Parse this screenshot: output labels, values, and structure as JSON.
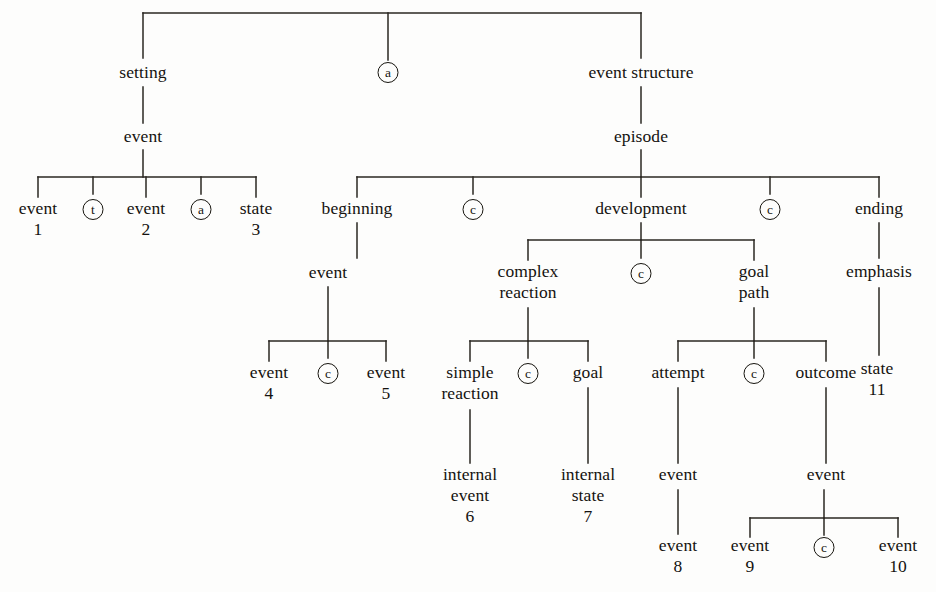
{
  "diagram": {
    "line_color": "#2a2722",
    "text_color": "#14120f",
    "background": "#fdfdfc"
  },
  "nodes": {
    "setting": {
      "label": "setting"
    },
    "root_connective_a": {
      "label": "a"
    },
    "event_structure": {
      "label": "event structure"
    },
    "setting_event": {
      "label": "event"
    },
    "event1": {
      "line1": "event",
      "line2": "1"
    },
    "connective_t": {
      "label": "t"
    },
    "event2": {
      "line1": "event",
      "line2": "2"
    },
    "connective_a_setting": {
      "label": "a"
    },
    "state3": {
      "line1": "state",
      "line2": "3"
    },
    "episode": {
      "label": "episode"
    },
    "beginning": {
      "label": "beginning"
    },
    "connective_c_1": {
      "label": "c"
    },
    "development": {
      "label": "development"
    },
    "connective_c_2": {
      "label": "c"
    },
    "ending": {
      "label": "ending"
    },
    "beginning_event": {
      "label": "event"
    },
    "complex_reaction": {
      "line1": "complex",
      "line2": "reaction"
    },
    "connective_c_3": {
      "label": "c"
    },
    "goal_path": {
      "line1": "goal",
      "line2": "path"
    },
    "emphasis": {
      "label": "emphasis"
    },
    "event4": {
      "line1": "event",
      "line2": "4"
    },
    "connective_c_4": {
      "label": "c"
    },
    "event5": {
      "line1": "event",
      "line2": "5"
    },
    "simple_reaction": {
      "line1": "simple",
      "line2": "reaction"
    },
    "connective_c_5": {
      "label": "c"
    },
    "goal": {
      "label": "goal"
    },
    "attempt": {
      "label": "attempt"
    },
    "connective_c_6": {
      "label": "c"
    },
    "outcome": {
      "label": "outcome"
    },
    "state11": {
      "line1": "state",
      "line2": "11"
    },
    "internal_event6": {
      "line1": "internal",
      "line2": "event",
      "line3": "6"
    },
    "internal_state7": {
      "line1": "internal",
      "line2": "state",
      "line3": "7"
    },
    "attempt_event": {
      "label": "event"
    },
    "outcome_event": {
      "label": "event"
    },
    "event8": {
      "line1": "event",
      "line2": "8"
    },
    "event9": {
      "line1": "event",
      "line2": "9"
    },
    "connective_c_7": {
      "label": "c"
    },
    "event10": {
      "line1": "event",
      "line2": "10"
    }
  },
  "tree_structure": {
    "root_children": [
      "setting",
      "a",
      "event structure"
    ],
    "setting_children": [
      "event"
    ],
    "setting_event_children": [
      "event 1",
      "t",
      "event 2",
      "a",
      "state 3"
    ],
    "event_structure_children": [
      "episode"
    ],
    "episode_children": [
      "beginning",
      "c",
      "development",
      "c",
      "ending"
    ],
    "beginning_children": [
      "event"
    ],
    "beginning_event_children": [
      "event 4",
      "c",
      "event 5"
    ],
    "development_children": [
      "complex reaction",
      "c",
      "goal path"
    ],
    "complex_reaction_children": [
      "simple reaction",
      "c",
      "goal"
    ],
    "simple_reaction_children": [
      "internal event 6"
    ],
    "goal_children": [
      "internal state 7"
    ],
    "goal_path_children": [
      "attempt",
      "c",
      "outcome"
    ],
    "attempt_children": [
      "event",
      "event 8"
    ],
    "outcome_children": [
      "event"
    ],
    "outcome_event_children": [
      "event 9",
      "c",
      "event 10"
    ],
    "ending_children": [
      "emphasis"
    ],
    "emphasis_children": [
      "state 11"
    ]
  }
}
